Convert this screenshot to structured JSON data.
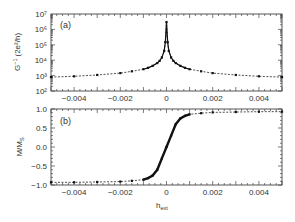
{
  "chart_data": [
    {
      "type": "line",
      "panel_label": "(a)",
      "xlabel": "",
      "ylabel": "G⁻¹ (2e²/h)",
      "yscale": "log",
      "xlim": [
        -0.005,
        0.005
      ],
      "ylim": [
        100,
        10000000
      ],
      "x_ticks": [
        "-0.004",
        "-0.002",
        "0",
        "0.002",
        "0.004"
      ],
      "y_ticks": [
        "10²",
        "10³",
        "10⁴",
        "10⁵",
        "10⁶",
        "10⁷"
      ],
      "grid": false,
      "series": [
        {
          "name": "G^-1",
          "style": "dashed line with filled markers",
          "x": [
            -0.005,
            -0.004,
            -0.003,
            -0.002,
            -0.0015,
            -0.001,
            -0.0008,
            -0.0006,
            -0.0004,
            -0.0003,
            -0.0002,
            -0.0001,
            -5e-05,
            0,
            5e-05,
            0.0001,
            0.0002,
            0.0003,
            0.0004,
            0.0006,
            0.0008,
            0.001,
            0.0015,
            0.002,
            0.003,
            0.004,
            0.005
          ],
          "y": [
            800,
            900,
            1100,
            1450,
            1900,
            2600,
            3200,
            4300,
            6500,
            9000,
            15000,
            40000,
            150000,
            3000000,
            150000,
            40000,
            15000,
            9000,
            6500,
            4300,
            3200,
            2600,
            1900,
            1450,
            1100,
            900,
            800
          ]
        }
      ]
    },
    {
      "type": "line",
      "panel_label": "(b)",
      "xlabel": "h_ext",
      "ylabel": "M/M_S",
      "xlim": [
        -0.005,
        0.005
      ],
      "ylim": [
        -1.0,
        1.0
      ],
      "x_ticks": [
        "-0.004",
        "-0.002",
        "0",
        "0.002",
        "0.004"
      ],
      "y_ticks": [
        "-1.0",
        "-0.5",
        "0.0",
        "0.5",
        "1.0"
      ],
      "grid": false,
      "series": [
        {
          "name": "M/M_S",
          "style": "dashed line with filled markers (dense near 0)",
          "x": [
            -0.005,
            -0.004,
            -0.003,
            -0.002,
            -0.0015,
            -0.001,
            -0.0008,
            -0.0006,
            -0.0004,
            -0.0002,
            0,
            0.0002,
            0.0004,
            0.0006,
            0.0008,
            0.001,
            0.0015,
            0.002,
            0.003,
            0.004,
            0.005
          ],
          "y": [
            -0.93,
            -0.93,
            -0.92,
            -0.91,
            -0.89,
            -0.86,
            -0.82,
            -0.75,
            -0.6,
            -0.3,
            0.0,
            0.3,
            0.6,
            0.75,
            0.82,
            0.86,
            0.89,
            0.91,
            0.92,
            0.93,
            0.93
          ]
        }
      ]
    }
  ],
  "labels": {
    "panel_a": "(a)",
    "panel_b": "(b)",
    "ylabel_a_main": "G",
    "ylabel_a_sup": "−1",
    "ylabel_a_unit": "(2e²/h)",
    "ylabel_b_main": "M/M",
    "ylabel_b_sub": "S",
    "xlabel_main": "h",
    "xlabel_sub": "ext"
  }
}
